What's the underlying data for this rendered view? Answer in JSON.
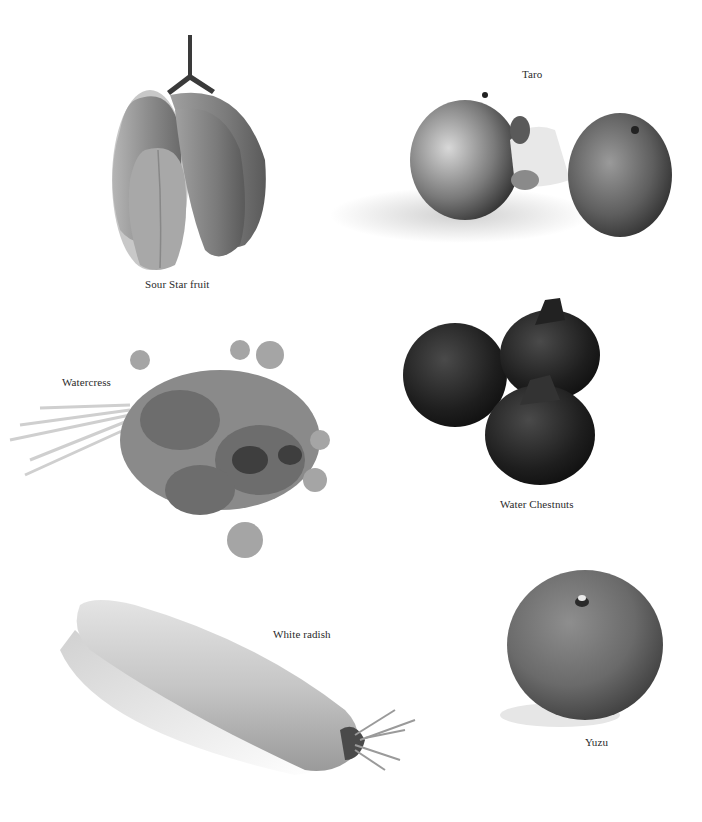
{
  "page": {
    "background": "#ffffff",
    "palette": "grayscale"
  },
  "items": [
    {
      "id": "starfruit",
      "label": "Sour Star fruit"
    },
    {
      "id": "taro",
      "label": "Taro"
    },
    {
      "id": "watercress",
      "label": "Watercress"
    },
    {
      "id": "water-chestnuts",
      "label": "Water Chestnuts"
    },
    {
      "id": "white-radish",
      "label": "White radish"
    },
    {
      "id": "yuzu",
      "label": "Yuzu"
    }
  ]
}
